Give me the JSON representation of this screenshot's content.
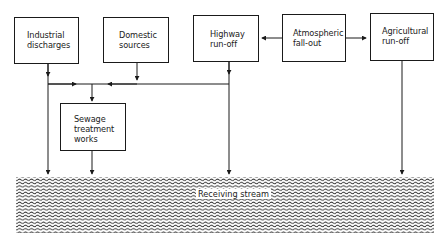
{
  "diagram": {
    "type": "flow",
    "nodes": [
      {
        "id": "industrial",
        "label": "Industrial\ndischarges"
      },
      {
        "id": "domestic",
        "label": "Domestic\nsources"
      },
      {
        "id": "highway",
        "label": "Highway\nrun-off"
      },
      {
        "id": "atmospheric",
        "label": "Atmospheric\nfall-out"
      },
      {
        "id": "agricultural",
        "label": "Agricultural\nrun-off"
      },
      {
        "id": "sewage",
        "label": "Sewage\ntreatment\nworks"
      }
    ],
    "stream": {
      "label": "Receiving stream"
    },
    "edges": [
      {
        "from": "atmospheric",
        "to": "highway"
      },
      {
        "from": "atmospheric",
        "to": "agricultural"
      },
      {
        "from": "industrial",
        "to": "sewage"
      },
      {
        "from": "domestic",
        "to": "sewage"
      },
      {
        "from": "highway",
        "to": "sewage"
      },
      {
        "from": "industrial",
        "to": "receiving-stream"
      },
      {
        "from": "sewage",
        "to": "receiving-stream"
      },
      {
        "from": "highway",
        "to": "receiving-stream"
      },
      {
        "from": "agricultural",
        "to": "receiving-stream"
      }
    ]
  }
}
